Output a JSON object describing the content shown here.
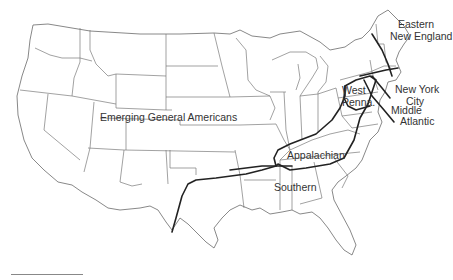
{
  "map": {
    "title": "US dialect regions",
    "regions": [
      {
        "id": "emerging-general-americans",
        "label": "Emerging General Americans"
      },
      {
        "id": "eastern-new-england",
        "label_lines": [
          "Eastern",
          "New England"
        ]
      },
      {
        "id": "new-york-city",
        "label_lines": [
          "New York",
          "City"
        ]
      },
      {
        "id": "middle-atlantic",
        "label_lines": [
          "Middle",
          "Atlantic"
        ]
      },
      {
        "id": "west-penna",
        "label_lines": [
          "West",
          "Penna."
        ]
      },
      {
        "id": "appalachian",
        "label": "Appalachian"
      },
      {
        "id": "southern",
        "label": "Southern"
      }
    ],
    "colors": {
      "background": "#ffffff",
      "state_border": "#7a7a7a",
      "dialect_boundary": "#222222",
      "label_text": "#333333"
    },
    "scale_bar": true
  }
}
